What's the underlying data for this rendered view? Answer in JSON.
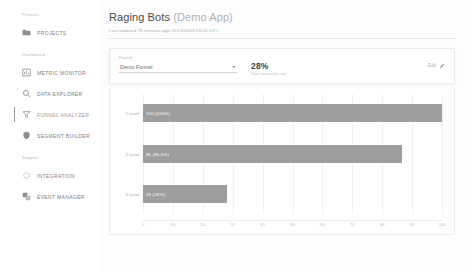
{
  "sidebar": {
    "sections": [
      {
        "label": "Projects",
        "items": [
          {
            "label": "PROJECTS",
            "icon": "folder-icon",
            "active": false
          }
        ]
      },
      {
        "label": "Dashboard",
        "items": [
          {
            "label": "METRIC MONITOR",
            "icon": "bar-chart-icon",
            "active": false
          },
          {
            "label": "DATA EXPLORER",
            "icon": "search-icon",
            "active": false
          },
          {
            "label": "FUNNEL ANALYZER",
            "icon": "funnel-icon",
            "active": true
          },
          {
            "label": "SEGMENT BUILDER",
            "icon": "shield-icon",
            "active": false
          }
        ]
      },
      {
        "label": "Support",
        "items": [
          {
            "label": "INTEGRATION",
            "icon": "integration-icon",
            "active": false
          },
          {
            "label": "EVENT MANAGER",
            "icon": "layers-icon",
            "active": false
          }
        ]
      }
    ]
  },
  "header": {
    "title": "Raging Bots",
    "title_suffix": "(Demo App)",
    "subtitle": "Last updated 76 minutes ago 05/13/2018 05:21 UTC"
  },
  "funnel_card": {
    "field_label": "Funnel",
    "selected_funnel": "Demo Funnel",
    "options": [
      "Demo Funnel"
    ],
    "metric_value": "28%",
    "metric_caption": "Total conversion rate",
    "edit_label": "Edit",
    "edit_icon": "pencil-icon"
  },
  "colors": {
    "bar": "#9e9e9e",
    "grid": "#f1f1f1",
    "accent": "#9b9b9b"
  },
  "chart_data": {
    "type": "bar",
    "orientation": "horizontal",
    "title": "",
    "xlabel": "",
    "ylabel": "",
    "xlim": [
      0,
      100
    ],
    "grid": true,
    "legend": false,
    "categories": [
      "1 Level",
      "2 Level",
      "3 Level"
    ],
    "values": [
      100,
      86.6,
      28
    ],
    "bar_labels": [
      "100 (100%)",
      "86 (86.6%)",
      "28 (28%)"
    ],
    "xticks": [
      0,
      10,
      20,
      30,
      40,
      50,
      60,
      70,
      80,
      90,
      100
    ]
  }
}
